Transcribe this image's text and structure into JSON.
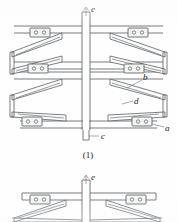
{
  "figure": {
    "caption_1": "(1)",
    "labels": {
      "a": "a",
      "b": "b",
      "c": "c",
      "d": "d",
      "e": "e",
      "e2": "e"
    }
  },
  "colors": {
    "line": "#555a5e",
    "fill": "#fdfdfd",
    "bracket_fill": "#f4f4f3",
    "text": "#1a1a1a",
    "background": "#fefefe"
  },
  "diagram": {
    "type": "mechanical-assembly-drawing",
    "figure_1": {
      "name": "upper-figure",
      "description": "Symmetric four-quadrant truss assembly with central vertical spine",
      "parts": [
        {
          "id": "e",
          "name": "upper-post",
          "label": "e"
        },
        {
          "id": "b",
          "name": "upper-diagonal-arm",
          "label": "b"
        },
        {
          "id": "d",
          "name": "lower-diagonal-arm",
          "label": "d"
        },
        {
          "id": "a",
          "name": "end-bracket",
          "label": "a"
        },
        {
          "id": "c",
          "name": "lower-post",
          "label": "c"
        }
      ]
    },
    "figure_2": {
      "name": "lower-figure-partial",
      "description": "Second view, cropped at image bottom edge",
      "parts": [
        {
          "id": "e2",
          "name": "upper-post",
          "label": "e"
        }
      ]
    }
  }
}
